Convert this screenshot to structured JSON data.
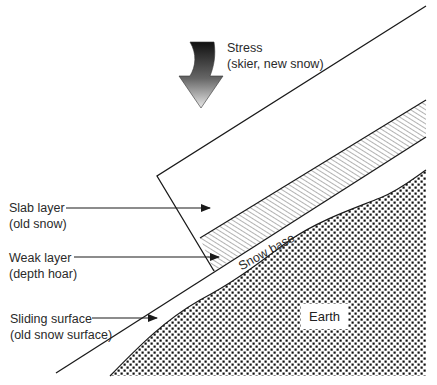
{
  "diagram": {
    "stress": {
      "line1": "Stress",
      "line2": "(skier, new snow)"
    },
    "labels": [
      {
        "id": "slab",
        "line1": "Slab layer",
        "line2": "(old snow)"
      },
      {
        "id": "weak",
        "line1": "Weak layer",
        "line2": "(depth hoar)"
      },
      {
        "id": "sliding",
        "line1": "Sliding surface",
        "line2": "(old snow surface)"
      }
    ],
    "snow_base": "Snow base",
    "earth": "Earth",
    "colors": {
      "line": "#1a1a1a",
      "text": "#2a2a2a",
      "dots": "#111111",
      "background": "#ffffff"
    }
  }
}
